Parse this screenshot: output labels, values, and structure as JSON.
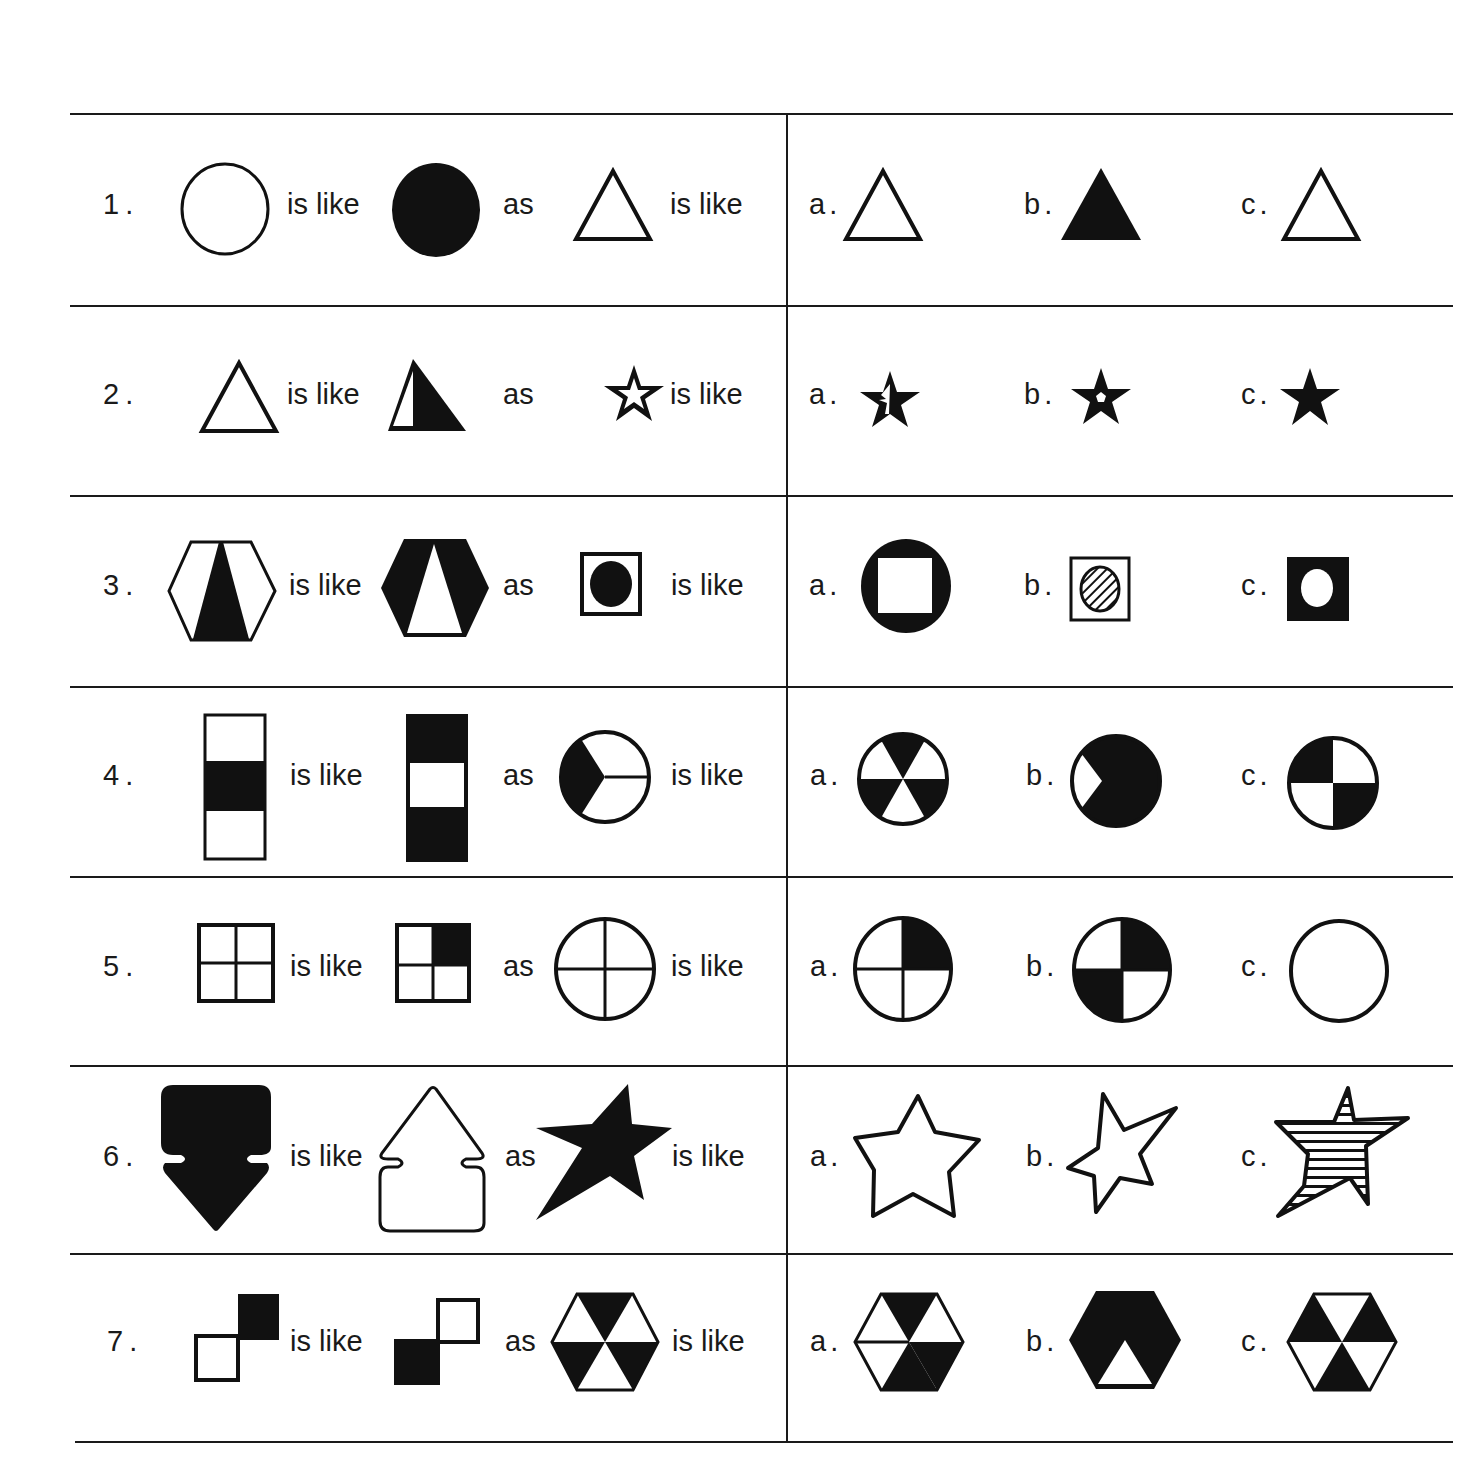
{
  "worksheet": {
    "connector_is_like": "is like",
    "connector_as": "as",
    "rows": [
      {
        "number": "1.",
        "prompt": [
          "open-circle",
          "filled-circle",
          "open-triangle"
        ],
        "options": [
          {
            "label": "a.",
            "figure": "open-triangle"
          },
          {
            "label": "b.",
            "figure": "filled-triangle"
          },
          {
            "label": "c.",
            "figure": "open-triangle"
          }
        ]
      },
      {
        "number": "2.",
        "prompt": [
          "open-triangle",
          "half-filled-triangle-right",
          "star-with-open-center"
        ],
        "options": [
          {
            "label": "a.",
            "figure": "star-half-open-center"
          },
          {
            "label": "b.",
            "figure": "star-small-pentagon-hole"
          },
          {
            "label": "c.",
            "figure": "filled-star"
          }
        ]
      },
      {
        "number": "3.",
        "prompt": [
          "white-hexagon-black-wedge",
          "black-hexagon-white-wedge",
          "white-square-black-circle"
        ],
        "options": [
          {
            "label": "a.",
            "figure": "black-circle-white-square"
          },
          {
            "label": "b.",
            "figure": "white-square-hatched-circle"
          },
          {
            "label": "c.",
            "figure": "black-square-white-circle"
          }
        ]
      },
      {
        "number": "4.",
        "prompt": [
          "bar-white-black-white",
          "bar-black-white-black",
          "circle-three-sectors-one-black"
        ],
        "options": [
          {
            "label": "a.",
            "figure": "circle-six-sectors-alternating"
          },
          {
            "label": "b.",
            "figure": "circle-black-with-white-wedge"
          },
          {
            "label": "c.",
            "figure": "circle-quarters-diagonal-black"
          }
        ]
      },
      {
        "number": "5.",
        "prompt": [
          "square-quartered",
          "square-quartered-top-right-black",
          "circle-quartered"
        ],
        "options": [
          {
            "label": "a.",
            "figure": "circle-quartered-top-right-black"
          },
          {
            "label": "b.",
            "figure": "circle-quartered-diagonal-black"
          },
          {
            "label": "c.",
            "figure": "plain-circle"
          }
        ]
      },
      {
        "number": "6.",
        "prompt": [
          "filled-down-arrow",
          "outline-up-arrow",
          "filled-tilted-star"
        ],
        "options": [
          {
            "label": "a.",
            "figure": "outline-star-upright"
          },
          {
            "label": "b.",
            "figure": "outline-star-tilted"
          },
          {
            "label": "c.",
            "figure": "striped-star"
          }
        ]
      },
      {
        "number": "7.",
        "prompt": [
          "two-squares-top-right-black",
          "two-squares-bottom-left-black",
          "hexagon-six-triangles-alternating"
        ],
        "options": [
          {
            "label": "a.",
            "figure": "hexagon-mixed-triangles"
          },
          {
            "label": "b.",
            "figure": "hexagon-black-bottom-white-triangle"
          },
          {
            "label": "c.",
            "figure": "hexagon-inverted-alternating"
          }
        ]
      }
    ]
  }
}
